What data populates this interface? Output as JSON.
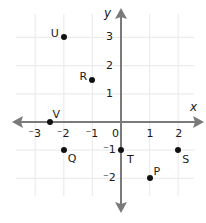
{
  "chart_data": {
    "type": "scatter",
    "title": "",
    "xlabel": "x",
    "ylabel": "y",
    "xlim": [
      -3.5,
      2.9
    ],
    "ylim": [
      -3.5,
      3.9
    ],
    "grid": true,
    "x_ticks": [
      -3,
      -2,
      -1,
      0,
      1,
      2
    ],
    "y_ticks": [
      -2,
      -1,
      1,
      2,
      3
    ],
    "x_tick_labels": [
      "⁻3",
      "⁻2",
      "⁻1",
      "0",
      "1",
      "2"
    ],
    "y_tick_labels": [
      "⁻2",
      "⁻1",
      "1",
      "2",
      "3"
    ],
    "points": [
      {
        "label": "U",
        "x": -2,
        "y": 3
      },
      {
        "label": "R",
        "x": -1,
        "y": 1.5
      },
      {
        "label": "V",
        "x": -2.5,
        "y": 0
      },
      {
        "label": "Q",
        "x": -2,
        "y": -1
      },
      {
        "label": "T",
        "x": 0,
        "y": -1
      },
      {
        "label": "S",
        "x": 2,
        "y": -1
      },
      {
        "label": "P",
        "x": 1,
        "y": -2
      }
    ]
  },
  "colors": {
    "axis": "#7a7a7a",
    "grid": "#ececec",
    "point": "#111111",
    "text": "#1a1a1a"
  }
}
